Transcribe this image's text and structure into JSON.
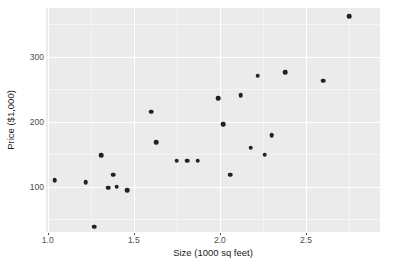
{
  "chart_data": {
    "type": "scatter",
    "title": "",
    "xlabel": "Size (1000 sq feet)",
    "ylabel": "Price ($1,000)",
    "xlim": [
      0.99,
      2.93
    ],
    "ylim": [
      30,
      375
    ],
    "xticks": [
      1.0,
      1.5,
      2.0,
      2.5
    ],
    "xtick_labels": [
      "1.0",
      "1.5",
      "2.0",
      "2.5"
    ],
    "yticks": [
      100,
      200,
      300
    ],
    "ytick_labels": [
      "100",
      "200",
      "300"
    ],
    "grid": true,
    "legend": "none",
    "point_color": "#222222",
    "panel_color": "#ebebeb",
    "gridline_color": "#ffffff",
    "points": [
      {
        "x": 1.04,
        "y": 110
      },
      {
        "x": 1.22,
        "y": 107
      },
      {
        "x": 1.27,
        "y": 38
      },
      {
        "x": 1.31,
        "y": 148
      },
      {
        "x": 1.35,
        "y": 98
      },
      {
        "x": 1.38,
        "y": 118
      },
      {
        "x": 1.4,
        "y": 100
      },
      {
        "x": 1.46,
        "y": 94
      },
      {
        "x": 1.6,
        "y": 215
      },
      {
        "x": 1.63,
        "y": 168
      },
      {
        "x": 1.75,
        "y": 140
      },
      {
        "x": 1.81,
        "y": 140
      },
      {
        "x": 1.87,
        "y": 140
      },
      {
        "x": 1.99,
        "y": 236
      },
      {
        "x": 2.02,
        "y": 196
      },
      {
        "x": 2.06,
        "y": 118
      },
      {
        "x": 2.12,
        "y": 241
      },
      {
        "x": 2.18,
        "y": 160
      },
      {
        "x": 2.22,
        "y": 271
      },
      {
        "x": 2.26,
        "y": 149
      },
      {
        "x": 2.3,
        "y": 179
      },
      {
        "x": 2.38,
        "y": 276
      },
      {
        "x": 2.6,
        "y": 263
      },
      {
        "x": 2.75,
        "y": 362
      }
    ]
  }
}
